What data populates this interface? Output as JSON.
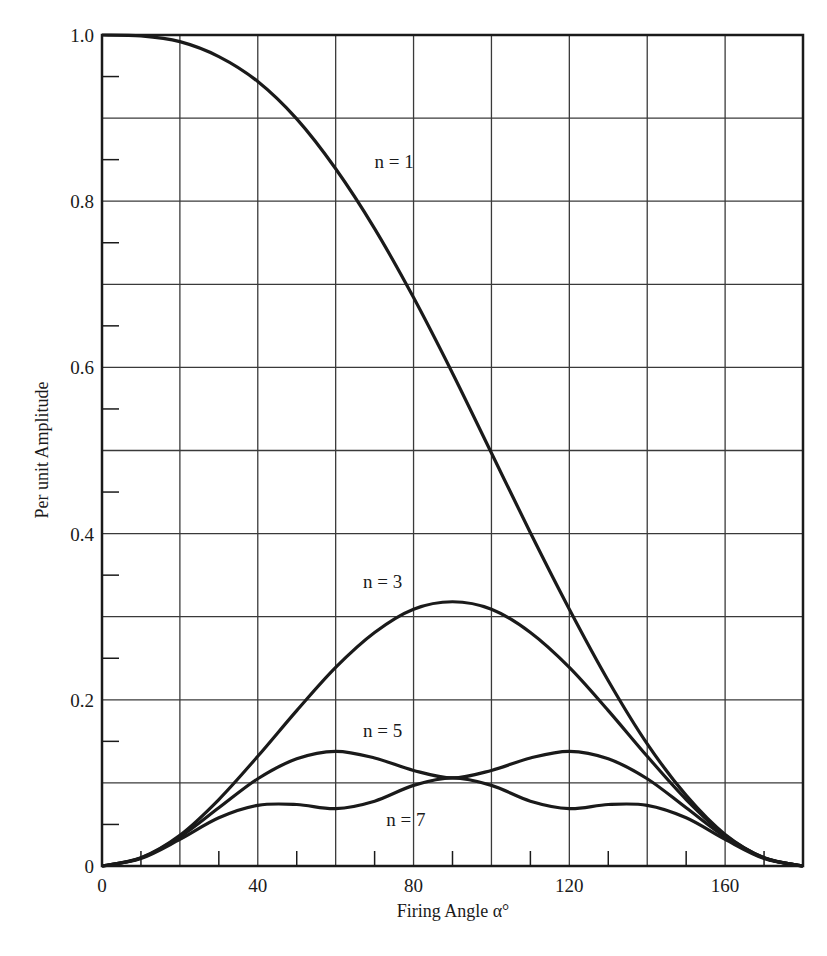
{
  "chart_data": {
    "type": "line",
    "title": "",
    "xlabel": "Firing Angle α°",
    "ylabel": "Per unit Amplitude",
    "xlim": [
      0,
      180
    ],
    "ylim": [
      0,
      1.0
    ],
    "grid": true,
    "x_major_ticks": [
      0,
      20,
      40,
      60,
      80,
      100,
      120,
      140,
      160,
      180
    ],
    "x_tick_labels": [
      {
        "value": 0,
        "label": "0"
      },
      {
        "value": 40,
        "label": "40"
      },
      {
        "value": 80,
        "label": "80"
      },
      {
        "value": 120,
        "label": "120"
      },
      {
        "value": 160,
        "label": "160"
      }
    ],
    "x_minor_ticks": [
      10,
      30,
      50,
      70,
      90,
      110,
      130,
      150,
      170
    ],
    "y_major_ticks": [
      0,
      0.1,
      0.2,
      0.3,
      0.4,
      0.5,
      0.6,
      0.7,
      0.8,
      0.9,
      1.0
    ],
    "y_tick_labels": [
      {
        "value": 0,
        "label": "0"
      },
      {
        "value": 0.2,
        "label": "0.2"
      },
      {
        "value": 0.4,
        "label": "0.4"
      },
      {
        "value": 0.6,
        "label": "0.6"
      },
      {
        "value": 0.8,
        "label": "0.8"
      },
      {
        "value": 1.0,
        "label": "1.0"
      }
    ],
    "y_minor_ticks": [
      0.05,
      0.15,
      0.25,
      0.35,
      0.45,
      0.55,
      0.65,
      0.75,
      0.85,
      0.95
    ],
    "x": [
      0,
      10,
      20,
      30,
      40,
      50,
      60,
      70,
      80,
      90,
      100,
      110,
      120,
      130,
      140,
      150,
      160,
      170,
      180
    ],
    "series": [
      {
        "name": "n = 1",
        "label_pos": [
          70,
          0.84
        ],
        "values": [
          1.0,
          0.999,
          0.992,
          0.974,
          0.944,
          0.899,
          0.839,
          0.767,
          0.684,
          0.593,
          0.497,
          0.401,
          0.309,
          0.223,
          0.147,
          0.085,
          0.038,
          0.01,
          0.0
        ]
      },
      {
        "name": "n = 3",
        "label_pos": [
          67,
          0.335
        ],
        "values": [
          0.0,
          0.01,
          0.037,
          0.08,
          0.132,
          0.187,
          0.239,
          0.281,
          0.309,
          0.318,
          0.309,
          0.281,
          0.239,
          0.187,
          0.132,
          0.08,
          0.037,
          0.01,
          0.0
        ]
      },
      {
        "name": "n = 5",
        "label_pos": [
          67,
          0.155
        ],
        "values": [
          0.0,
          0.0095,
          0.035,
          0.07,
          0.105,
          0.129,
          0.138,
          0.13,
          0.115,
          0.106,
          0.115,
          0.13,
          0.138,
          0.129,
          0.105,
          0.07,
          0.035,
          0.0095,
          0.0
        ]
      },
      {
        "name": "n = 7",
        "label_pos": [
          73,
          0.048
        ],
        "values": [
          0.0,
          0.009,
          0.032,
          0.058,
          0.073,
          0.074,
          0.069,
          0.078,
          0.097,
          0.106,
          0.097,
          0.078,
          0.069,
          0.074,
          0.073,
          0.058,
          0.032,
          0.009,
          0.0
        ]
      }
    ]
  },
  "style": {
    "line_color": "#1a1a1a",
    "grid_color": "#3a3a3a",
    "background": "#ffffff"
  }
}
